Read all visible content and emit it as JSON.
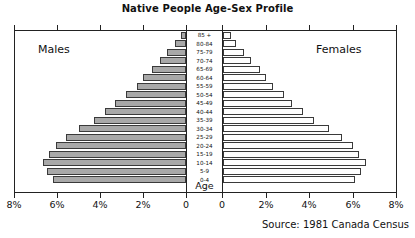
{
  "chart": {
    "title": "Native People Age-Sex Profile",
    "source": "Source: 1981 Canada Census",
    "left_caption": "Males",
    "right_caption": "Females",
    "axis_caption": "Age"
  },
  "axis": {
    "left_ticks": [
      "8%",
      "6%",
      "4%",
      "2%",
      "0"
    ],
    "right_ticks": [
      "0",
      "2%",
      "4%",
      "6%",
      "8%"
    ]
  },
  "colors": {
    "male_bar_fill": "#a8a8a8",
    "female_bar_fill": "#ffffff",
    "bar_stroke": "#3a3a3a",
    "frame": "#222222",
    "text": "#111111",
    "background": "#ffffff"
  },
  "chart_data": {
    "type": "bar",
    "subtype": "population-pyramid",
    "title": "Native People Age-Sex Profile",
    "xlabel": "",
    "ylabel": "Age",
    "xlim": [
      0,
      8
    ],
    "grid": false,
    "legend": [
      "Males",
      "Females"
    ],
    "legend_position": "inside-top-corners",
    "annotations": [
      "Source: 1981 Canada Census"
    ],
    "axis_tick_values": [
      0,
      2,
      4,
      6,
      8
    ],
    "axis_tick_labels": [
      "0",
      "2%",
      "4%",
      "6%",
      "8%"
    ],
    "categories": [
      "85 +",
      "80-84",
      "75-79",
      "70-74",
      "65-69",
      "60-64",
      "55-59",
      "50-54",
      "45-49",
      "40-44",
      "35-39",
      "30-34",
      "25-29",
      "20-24",
      "15-19",
      "10-14",
      "5-9",
      "0-4"
    ],
    "series": [
      {
        "name": "Males",
        "direction": "left",
        "units": "percent",
        "values": [
          0.25,
          0.5,
          0.9,
          1.2,
          1.6,
          2.0,
          2.3,
          2.8,
          3.3,
          3.8,
          4.3,
          5.0,
          5.6,
          6.1,
          6.4,
          6.7,
          6.5,
          6.2
        ]
      },
      {
        "name": "Females",
        "direction": "right",
        "units": "percent",
        "values": [
          0.35,
          0.6,
          0.95,
          1.3,
          1.7,
          2.0,
          2.3,
          2.8,
          3.2,
          3.7,
          4.2,
          4.9,
          5.5,
          6.0,
          6.3,
          6.6,
          6.4,
          6.1
        ]
      }
    ]
  }
}
